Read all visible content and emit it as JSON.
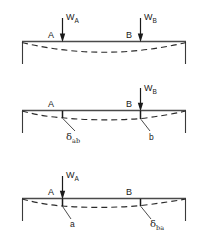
{
  "figure": {
    "colors": {
      "ink": "#1a1a1a",
      "beam": "#4a4a4a",
      "dashed": "#2b2b2b",
      "background": "#ffffff"
    }
  },
  "panels": [
    {
      "id": "panel-1",
      "caption": "Both loads applied",
      "point_labels": [
        {
          "name": "A",
          "text": "A"
        },
        {
          "name": "B",
          "text": "B"
        }
      ],
      "load_labels": [
        {
          "name": "W_A",
          "symbol": "W",
          "subscript": "A"
        },
        {
          "name": "W_B",
          "symbol": "W",
          "subscript": "B"
        }
      ],
      "deflection_labels": []
    },
    {
      "id": "panel-2",
      "caption": "Load W_B applied at B only",
      "point_labels": [
        {
          "name": "A",
          "text": "A"
        },
        {
          "name": "B",
          "text": "B"
        }
      ],
      "load_labels": [
        {
          "name": "W_B",
          "symbol": "W",
          "subscript": "B"
        }
      ],
      "deflection_labels": [
        {
          "name": "delta_ab",
          "symbol": "δ",
          "subscript": "ab"
        },
        {
          "name": "b",
          "symbol": "b",
          "subscript": ""
        }
      ]
    },
    {
      "id": "panel-3",
      "caption": "Load W_A applied at A only",
      "point_labels": [
        {
          "name": "A",
          "text": "A"
        },
        {
          "name": "B",
          "text": "B"
        }
      ],
      "load_labels": [
        {
          "name": "W_A",
          "symbol": "W",
          "subscript": "A"
        }
      ],
      "deflection_labels": [
        {
          "name": "a",
          "symbol": "a",
          "subscript": ""
        },
        {
          "name": "delta_ba",
          "symbol": "δ",
          "subscript": "ba"
        }
      ]
    }
  ],
  "text": {
    "p1_A": "A",
    "p1_B": "B",
    "p1_WA_sym": "W",
    "p1_WA_sub": "A",
    "p1_WB_sym": "W",
    "p1_WB_sub": "B",
    "p2_A": "A",
    "p2_B": "B",
    "p2_WB_sym": "W",
    "p2_WB_sub": "B",
    "p2_delta_sym": "δ",
    "p2_delta_sub": "ab",
    "p2_b": "b",
    "p3_A": "A",
    "p3_B": "B",
    "p3_WA_sym": "W",
    "p3_WA_sub": "A",
    "p3_a": "a",
    "p3_delta_sym": "δ",
    "p3_delta_sub": "ba"
  }
}
